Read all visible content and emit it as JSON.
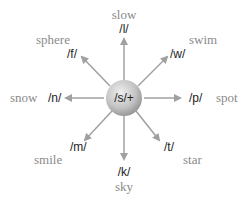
{
  "center": {
    "label": "/s/+"
  },
  "colors": {
    "arrow": "#a0a0a0",
    "word": "#8a8a8a",
    "phoneme": "#222222",
    "circle_light": "#e6e6e6",
    "circle_dark": "#9a9a9a"
  },
  "branches": [
    {
      "direction": "N",
      "phoneme": "/l/",
      "word": "slow"
    },
    {
      "direction": "NE",
      "phoneme": "/w/",
      "word": "swim"
    },
    {
      "direction": "E",
      "phoneme": "/p/",
      "word": "spot"
    },
    {
      "direction": "SE",
      "phoneme": "/t/",
      "word": "star"
    },
    {
      "direction": "S",
      "phoneme": "/k/",
      "word": "sky"
    },
    {
      "direction": "SW",
      "phoneme": "/m/",
      "word": "smile"
    },
    {
      "direction": "W",
      "phoneme": "/n/",
      "word": "snow"
    },
    {
      "direction": "NW",
      "phoneme": "/f/",
      "word": "sphere"
    }
  ]
}
